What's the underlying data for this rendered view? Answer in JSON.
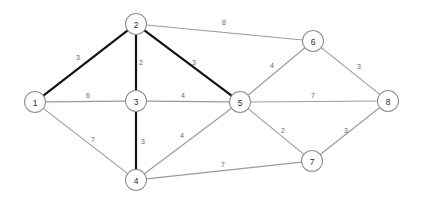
{
  "diagram": {
    "type": "weighted-undirected-graph",
    "title": "",
    "background_color": "#ffffff",
    "node_fill": "#ffffff",
    "node_stroke": "#8f8f8f",
    "edge_color": "#9a9a9a",
    "highlight_color": "#141414",
    "weight_label_color": "#666666",
    "node_radius": 10.5
  },
  "nodes": [
    {
      "id": "1",
      "label": "1",
      "x": 35,
      "y": 102
    },
    {
      "id": "2",
      "label": "2",
      "x": 136,
      "y": 24
    },
    {
      "id": "3",
      "label": "3",
      "x": 136,
      "y": 101
    },
    {
      "id": "4",
      "label": "4",
      "x": 136,
      "y": 180
    },
    {
      "id": "5",
      "label": "5",
      "x": 240,
      "y": 102
    },
    {
      "id": "6",
      "label": "6",
      "x": 313,
      "y": 41
    },
    {
      "id": "7",
      "label": "7",
      "x": 312,
      "y": 161
    },
    {
      "id": "8",
      "label": "8",
      "x": 388,
      "y": 101
    }
  ],
  "edges": [
    {
      "from": "1",
      "to": "2",
      "weight": "3",
      "highlighted": true,
      "label_x": 78,
      "label_y": 57
    },
    {
      "from": "1",
      "to": "3",
      "weight": "6",
      "highlighted": false,
      "label_x": 88,
      "label_y": 95
    },
    {
      "from": "1",
      "to": "4",
      "weight": "7",
      "highlighted": false,
      "label_x": 93,
      "label_y": 139
    },
    {
      "from": "2",
      "to": "3",
      "weight": "2",
      "highlighted": true,
      "label_x": 141,
      "label_y": 62
    },
    {
      "from": "2",
      "to": "5",
      "weight": "3",
      "highlighted": true,
      "label_x": 194,
      "label_y": 62
    },
    {
      "from": "2",
      "to": "6",
      "weight": "8",
      "highlighted": false,
      "label_x": 224,
      "label_y": 22
    },
    {
      "from": "3",
      "to": "4",
      "weight": "3",
      "highlighted": true,
      "label_x": 143,
      "label_y": 141
    },
    {
      "from": "3",
      "to": "5",
      "weight": "4",
      "highlighted": false,
      "label_x": 183,
      "label_y": 95
    },
    {
      "from": "4",
      "to": "5",
      "weight": "4",
      "highlighted": false,
      "label_x": 182,
      "label_y": 135
    },
    {
      "from": "4",
      "to": "7",
      "weight": "7",
      "highlighted": false,
      "label_x": 223,
      "label_y": 164
    },
    {
      "from": "5",
      "to": "6",
      "weight": "4",
      "highlighted": false,
      "label_x": 272,
      "label_y": 65
    },
    {
      "from": "5",
      "to": "7",
      "weight": "2",
      "highlighted": false,
      "label_x": 283,
      "label_y": 130
    },
    {
      "from": "5",
      "to": "8",
      "weight": "7",
      "highlighted": false,
      "label_x": 313,
      "label_y": 95
    },
    {
      "from": "6",
      "to": "8",
      "weight": "3",
      "highlighted": false,
      "label_x": 359,
      "label_y": 66
    },
    {
      "from": "7",
      "to": "8",
      "weight": "3",
      "highlighted": false,
      "label_x": 346,
      "label_y": 130
    }
  ]
}
